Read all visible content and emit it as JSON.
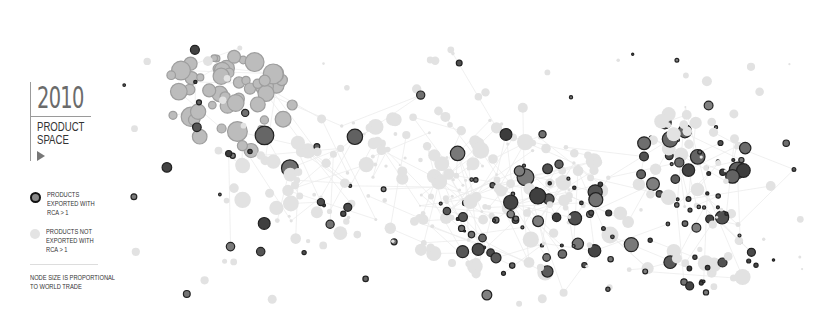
{
  "panel": {
    "year": "2010",
    "title_line1": "PRODUCT",
    "title_line2": "SPACE",
    "play_icon": "play-triangle-icon"
  },
  "legend": {
    "exported": {
      "line1": "PRODUCTS",
      "line2": "EXPORTED WITH",
      "line3": "RCA > 1"
    },
    "not_exported": {
      "line1": "PRODUCTS NOT",
      "line2": "EXPORTED WITH",
      "line3": "RCA > 1"
    },
    "note_line1": "NODE SIZE IS PROPORTIONAL",
    "note_line2": "TO WORLD TRADE"
  },
  "colors": {
    "exported_fill": "#777777",
    "exported_stroke": "#222222",
    "not_exported_fill": "#e2e2e2",
    "edge": "#ececec"
  },
  "network": {
    "description": "Product space network; darker nodes are products exported with RCA > 1, light nodes are not",
    "clusters": [
      {
        "name": "garments",
        "rca_share": 0.05,
        "tone": "mid-light"
      },
      {
        "name": "core-machinery",
        "rca_share": 0.1,
        "tone": "light"
      },
      {
        "name": "electronics",
        "rca_share": 0.6,
        "tone": "dark"
      },
      {
        "name": "chemicals",
        "rca_share": 0.7,
        "tone": "dark"
      },
      {
        "name": "metals",
        "rca_share": 0.55,
        "tone": "dark"
      }
    ]
  }
}
